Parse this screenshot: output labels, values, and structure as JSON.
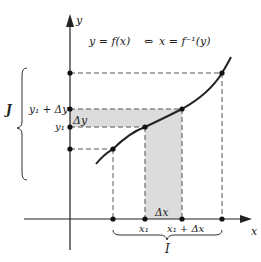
{
  "diagram": {
    "equation": "y = f(x)  ⇔  x = f⁻¹(y)",
    "equation_parts": {
      "left": "y = f(x)",
      "arrow": "⇔",
      "right": "x = f⁻¹(y)"
    },
    "axes": {
      "x_label": "x",
      "y_label": "y"
    },
    "y_labels": {
      "y1_plus_dy": "y₁ + Δy",
      "y1": "y₁",
      "interval": "J"
    },
    "x_labels": {
      "x1": "x₁",
      "x1_plus_dx": "x₁ + Δx",
      "interval": "I"
    },
    "deltas": {
      "dy": "Δy",
      "dx": "Δx"
    },
    "colors": {
      "ink": "#222222",
      "shade": "#dcdcdc",
      "dash": "#555555"
    }
  }
}
